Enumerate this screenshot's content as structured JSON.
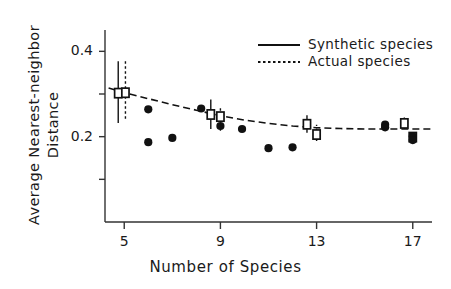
{
  "chart_data": {
    "type": "scatter",
    "title": "",
    "xlabel": "Number of Species",
    "ylabel": "Average Nearest-neighbor Distance",
    "ylabel_lines": [
      "Average Nearest-neighbor",
      "Distance"
    ],
    "xlim": [
      4.2,
      17.8
    ],
    "ylim": [
      0.0,
      0.45
    ],
    "grid": false,
    "xticks": [
      5,
      9,
      13,
      17
    ],
    "xtick_labels": [
      "5",
      "9",
      "13",
      "17"
    ],
    "yticks": [
      0.1,
      0.2,
      0.3,
      0.4
    ],
    "ytick_labels": [
      "",
      "0.2",
      "",
      "0.4"
    ],
    "legend_position": "top-right",
    "legend": [
      {
        "label": "Synthetic species",
        "style": "solid"
      },
      {
        "label": "Actual species",
        "style": "dotted"
      }
    ],
    "series": [
      {
        "name": "Synthetic species",
        "style": "solid",
        "marker": "square-with-errorbar",
        "points": [
          {
            "x": 4.75,
            "y": 0.302,
            "err_low": 0.232,
            "err_high": 0.377
          },
          {
            "x": 8.6,
            "y": 0.252,
            "err_low": 0.218,
            "err_high": 0.287
          },
          {
            "x": 12.6,
            "y": 0.229,
            "err_low": 0.209,
            "err_high": 0.25
          },
          {
            "x": 16.65,
            "y": 0.231,
            "err_low": 0.218,
            "err_high": 0.245
          }
        ]
      },
      {
        "name": "Actual species",
        "style": "dotted",
        "marker": "square-with-errorbar",
        "points": [
          {
            "x": 5.05,
            "y": 0.303,
            "err_low": 0.242,
            "err_high": 0.378
          },
          {
            "x": 9.0,
            "y": 0.247,
            "err_low": 0.214,
            "err_high": 0.268
          },
          {
            "x": 13.0,
            "y": 0.205,
            "err_low": 0.19,
            "err_high": 0.228
          },
          {
            "x": 17.0,
            "y": 0.199,
            "err_low": 0.19,
            "err_high": 0.212
          }
        ]
      },
      {
        "name": "Individual replicate points",
        "style": "none",
        "marker": "filled-circle",
        "points": [
          {
            "x": 6.0,
            "y": 0.264
          },
          {
            "x": 6.0,
            "y": 0.187
          },
          {
            "x": 7.0,
            "y": 0.197
          },
          {
            "x": 8.2,
            "y": 0.266
          },
          {
            "x": 9.0,
            "y": 0.225
          },
          {
            "x": 9.9,
            "y": 0.218
          },
          {
            "x": 11.0,
            "y": 0.173
          },
          {
            "x": 12.0,
            "y": 0.175
          },
          {
            "x": 15.85,
            "y": 0.228
          },
          {
            "x": 15.85,
            "y": 0.222
          },
          {
            "x": 17.0,
            "y": 0.201
          },
          {
            "x": 17.0,
            "y": 0.192
          }
        ]
      }
    ],
    "trend_line": {
      "name": "Actual species fit",
      "style": "dashed",
      "points": [
        {
          "x": 4.35,
          "y": 0.314
        },
        {
          "x": 5.0,
          "y": 0.303
        },
        {
          "x": 6.0,
          "y": 0.289
        },
        {
          "x": 7.0,
          "y": 0.275
        },
        {
          "x": 8.0,
          "y": 0.262
        },
        {
          "x": 9.0,
          "y": 0.249
        },
        {
          "x": 10.0,
          "y": 0.239
        },
        {
          "x": 11.0,
          "y": 0.231
        },
        {
          "x": 12.0,
          "y": 0.225
        },
        {
          "x": 13.0,
          "y": 0.221
        },
        {
          "x": 14.0,
          "y": 0.219
        },
        {
          "x": 15.0,
          "y": 0.218
        },
        {
          "x": 16.0,
          "y": 0.218
        },
        {
          "x": 17.0,
          "y": 0.218
        },
        {
          "x": 17.8,
          "y": 0.218
        }
      ]
    },
    "colors": {
      "axis": "#333333",
      "marker": "#111111",
      "line": "#111111",
      "background": "#ffffff"
    }
  }
}
